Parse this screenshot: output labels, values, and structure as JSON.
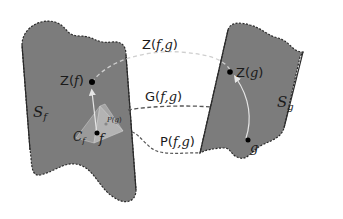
{
  "diagram": {
    "type": "manifold-mapping",
    "colors": {
      "background": "#ffffff",
      "manifold_fill": "#7c7c7c",
      "manifold_border": "#2a2a2a",
      "curve_light": "#cfcfcf",
      "curve_dark": "#555555",
      "pyramid_light": "#b8b8b8",
      "pyramid_mid": "#a6a6a6",
      "point": "#000000"
    },
    "manifolds": [
      {
        "id": "left",
        "label_main": "S",
        "label_sub": "f"
      },
      {
        "id": "right",
        "label_main": "S",
        "label_sub": "g"
      }
    ],
    "points": {
      "zf": {
        "label_prefix": "Z(",
        "label_var": "f",
        "label_suffix": ")"
      },
      "zg": {
        "label_prefix": "Z(",
        "label_var": "g",
        "label_suffix": ")"
      },
      "f": {
        "label": "f"
      },
      "g": {
        "label": "g"
      }
    },
    "pyramid": {
      "cone_main": "C",
      "cone_sub": "f",
      "proj_label_prefix": "P(",
      "proj_label_var": "g",
      "proj_label_suffix": ")"
    },
    "connections": [
      {
        "id": "Z",
        "prefix": "Z(",
        "vars": "f,g",
        "suffix": ")",
        "style": "light-dashed"
      },
      {
        "id": "G",
        "prefix": "G(",
        "vars": "f,g",
        "suffix": ")",
        "style": "dark-dashed"
      },
      {
        "id": "P",
        "prefix": "P(",
        "vars": "f,g",
        "suffix": ")",
        "style": "dark-dashed-wavy"
      }
    ]
  }
}
